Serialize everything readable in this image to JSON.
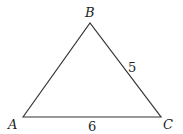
{
  "diagram": {
    "type": "triangle",
    "vertices": [
      {
        "name": "A",
        "x": 23,
        "y": 117
      },
      {
        "name": "B",
        "x": 90,
        "y": 23
      },
      {
        "name": "C",
        "x": 161,
        "y": 117
      }
    ],
    "edges": [
      {
        "from": "A",
        "to": "B",
        "label": ""
      },
      {
        "from": "B",
        "to": "C",
        "label": "5"
      },
      {
        "from": "A",
        "to": "C",
        "label": "6"
      }
    ],
    "labels": {
      "A": "A",
      "B": "B",
      "C": "C",
      "BC": "5",
      "AC": "6"
    },
    "stroke_color": "#333333"
  }
}
